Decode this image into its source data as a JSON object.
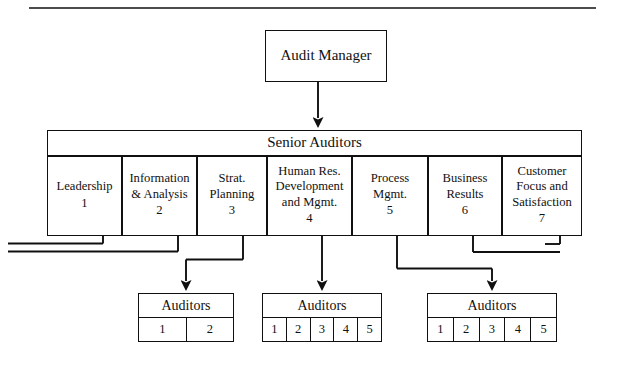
{
  "diagram": {
    "title_box": {
      "label": "Audit Manager"
    },
    "mid_box": {
      "label": "Senior Auditors"
    },
    "categories": [
      {
        "name": "Leadership",
        "number": "1"
      },
      {
        "name": "Information\n& Analysis",
        "number": "2"
      },
      {
        "name": "Strat.\nPlanning",
        "number": "3"
      },
      {
        "name": "Human Res.\nDevelopment\nand Mgmt.",
        "number": "4"
      },
      {
        "name": "Process\nMgmt.",
        "number": "5"
      },
      {
        "name": "Business\nResults",
        "number": "6"
      },
      {
        "name": "Customer\nFocus and\nSatisfaction",
        "number": "7"
      }
    ],
    "auditor_groups": [
      {
        "label": "Auditors",
        "cells": [
          "1",
          "2"
        ]
      },
      {
        "label": "Auditors",
        "cells": [
          "1",
          "2",
          "3",
          "4",
          "5"
        ]
      },
      {
        "label": "Auditors",
        "cells": [
          "1",
          "2",
          "3",
          "4",
          "5"
        ]
      }
    ],
    "colors": {
      "line": "#101010",
      "background": "#ffffff",
      "text": "#111111"
    }
  }
}
